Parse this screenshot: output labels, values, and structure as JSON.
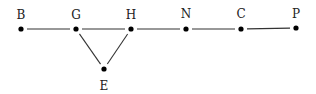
{
  "diagram": {
    "type": "graph",
    "nodes": [
      {
        "id": "B",
        "label": "B",
        "x": 21,
        "y": 29,
        "label_x": 21,
        "label_y": 19
      },
      {
        "id": "G",
        "label": "G",
        "x": 76,
        "y": 29,
        "label_x": 76,
        "label_y": 19
      },
      {
        "id": "H",
        "label": "H",
        "x": 131,
        "y": 29,
        "label_x": 131,
        "label_y": 19
      },
      {
        "id": "N",
        "label": "N",
        "x": 186,
        "y": 29,
        "label_x": 186,
        "label_y": 18
      },
      {
        "id": "C",
        "label": "C",
        "x": 241,
        "y": 29,
        "label_x": 241,
        "label_y": 18
      },
      {
        "id": "P",
        "label": "P",
        "x": 296,
        "y": 28,
        "label_x": 296,
        "label_y": 18
      },
      {
        "id": "E",
        "label": "E",
        "x": 104,
        "y": 69,
        "label_x": 104,
        "label_y": 90
      }
    ],
    "edges": [
      {
        "from": "B",
        "to": "G"
      },
      {
        "from": "G",
        "to": "H"
      },
      {
        "from": "H",
        "to": "N"
      },
      {
        "from": "N",
        "to": "C"
      },
      {
        "from": "C",
        "to": "P"
      },
      {
        "from": "G",
        "to": "E"
      },
      {
        "from": "H",
        "to": "E"
      }
    ],
    "colors": {
      "node": "#000000",
      "edge": "#333333",
      "label": "#222222",
      "background": "#ffffff"
    }
  }
}
